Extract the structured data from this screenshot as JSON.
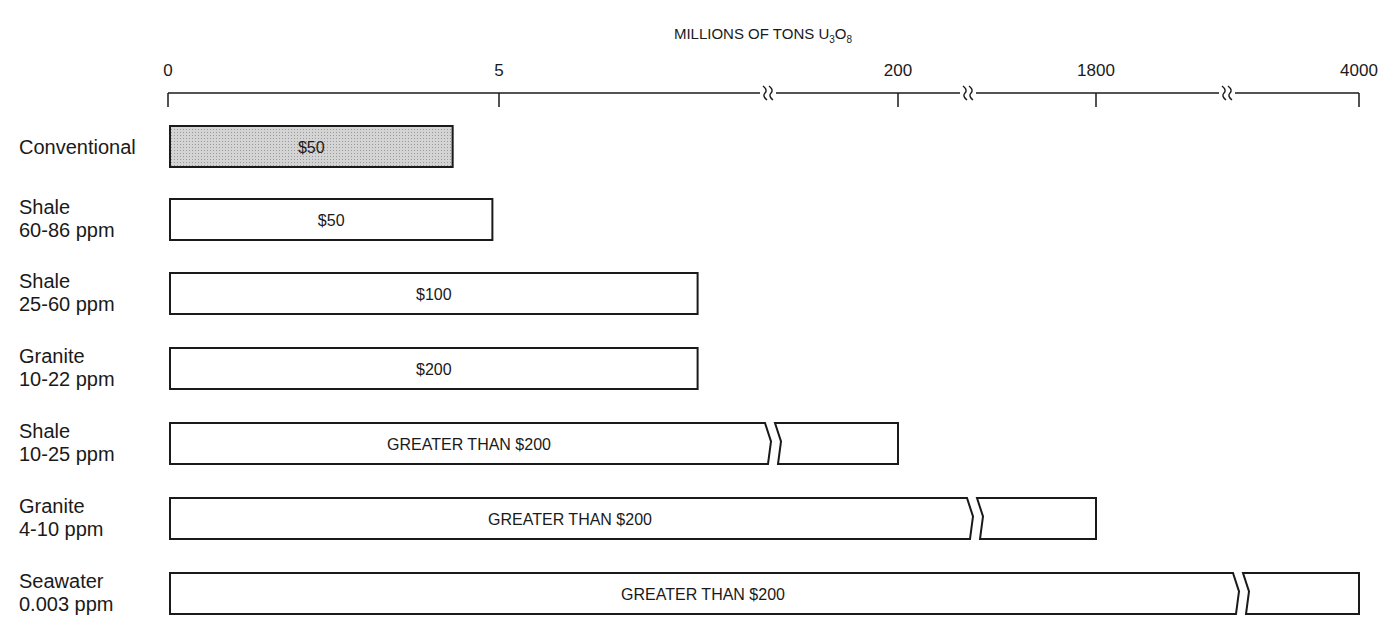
{
  "chart_data": {
    "type": "bar",
    "orientation": "horizontal",
    "title": "MILLIONS OF TONS U3O8",
    "title_parts": {
      "main": "MILLIONS OF TONS U",
      "sub1": "3",
      "mid": "O",
      "sub2": "8"
    },
    "xlabel": "MILLIONS OF TONS U3O8",
    "ylabel": "",
    "axis_position": "top",
    "axis_breaks": true,
    "x_ticks": [
      {
        "value": 0,
        "label": "0"
      },
      {
        "value": 5,
        "label": "5"
      },
      {
        "value": 200,
        "label": "200"
      },
      {
        "value": 1800,
        "label": "1800"
      },
      {
        "value": 4000,
        "label": "4000"
      }
    ],
    "xlim": [
      0,
      4000
    ],
    "grid": false,
    "legend": "none",
    "categories": [
      {
        "name": "Conventional",
        "detail": ""
      },
      {
        "name": "Shale",
        "detail": "60-86 ppm"
      },
      {
        "name": "Shale",
        "detail": "25-60 ppm"
      },
      {
        "name": "Granite",
        "detail": "10-22 ppm"
      },
      {
        "name": "Shale",
        "detail": "10-25 ppm"
      },
      {
        "name": "Granite",
        "detail": "4-10 ppm"
      },
      {
        "name": "Seawater",
        "detail": "0.003 ppm"
      }
    ],
    "values": [
      4.3,
      4.9,
      8,
      8,
      200,
      1800,
      4000
    ],
    "bar_labels": [
      "$50",
      "$50",
      "$100",
      "$200",
      "GREATER THAN $200",
      "GREATER THAN $200",
      "GREATER THAN $200"
    ],
    "bar_broken": [
      false,
      false,
      false,
      false,
      true,
      true,
      true
    ],
    "bar_fill": [
      "shaded",
      "white",
      "white",
      "white",
      "white",
      "white",
      "white"
    ],
    "colors": {
      "shaded": "#c9c9c9",
      "white": "#ffffff",
      "stroke": "#1a1a1a"
    }
  }
}
